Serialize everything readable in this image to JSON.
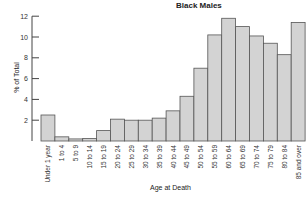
{
  "chart_data": {
    "type": "bar",
    "title": "Black Males",
    "xlabel": "Age at Death",
    "ylabel": "% of Total",
    "ylim": [
      0,
      12
    ],
    "yticks": [
      2,
      4,
      6,
      8,
      10,
      12
    ],
    "grid": false,
    "categories": [
      "Under 1 year",
      "1 to 4",
      "5 to 9",
      "10 to 14",
      "15 to 19",
      "20 to 24",
      "25 to 29",
      "30 to 34",
      "35 to 39",
      "40 to 44",
      "45 to 49",
      "50 to 54",
      "55 to 59",
      "60 to 64",
      "65 to 69",
      "70 to 74",
      "75 to 79",
      "80 to 84",
      "85 and over"
    ],
    "values": [
      2.5,
      0.4,
      0.2,
      0.25,
      1.0,
      2.1,
      2.0,
      2.0,
      2.2,
      2.9,
      4.3,
      7.0,
      10.2,
      11.8,
      11.0,
      10.1,
      9.4,
      8.3,
      11.4
    ],
    "bar_color": "#d3d3d3",
    "edge_color": "#555555"
  }
}
